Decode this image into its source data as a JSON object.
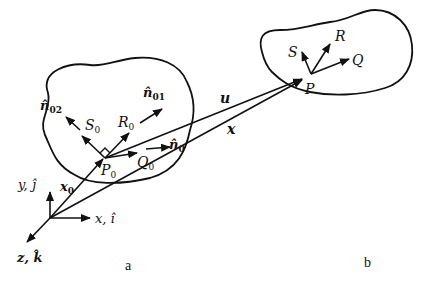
{
  "figure": {
    "panels": [
      {
        "id": "a",
        "caption": "a"
      },
      {
        "id": "b",
        "caption": "b"
      }
    ]
  },
  "axes": {
    "x_label": "x, î",
    "y_label": "y, ĵ",
    "z_label": "z, k̂"
  },
  "vectors": {
    "x0": {
      "base": "x",
      "sub": "0"
    },
    "u": "u",
    "x": "x"
  },
  "body_a": {
    "point": {
      "base": "P",
      "sub": "0"
    },
    "frame": [
      {
        "base": "S",
        "sub": "0"
      },
      {
        "base": "R",
        "sub": "0"
      },
      {
        "base": "Q",
        "sub": "0"
      }
    ],
    "normals": [
      {
        "base": "n̂",
        "sub": "0"
      },
      {
        "base": "n̂",
        "sub": "01"
      },
      {
        "base": "n̂",
        "sub": "02"
      }
    ]
  },
  "body_b": {
    "point": "P",
    "frame": [
      "S",
      "R",
      "Q"
    ]
  },
  "colors": {
    "ink": "#111111",
    "background": "#ffffff"
  }
}
